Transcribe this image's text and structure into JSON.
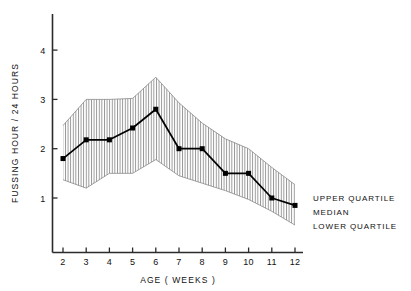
{
  "chart_data": {
    "type": "line",
    "title": "",
    "subtitle": "",
    "xlabel": "AGE  ( WEEKS )",
    "ylabel": "FUSSING HOUR / 24 HOURS",
    "x": [
      2,
      3,
      4,
      5,
      6,
      7,
      8,
      9,
      10,
      11,
      12
    ],
    "xtick_labels": [
      "2",
      "3",
      "4",
      "5",
      "6",
      "7",
      "8",
      "9",
      "10",
      "11",
      "12"
    ],
    "ytick_labels": [
      "1",
      "2",
      "3",
      "4"
    ],
    "yticks": [
      1,
      2,
      3,
      4
    ],
    "xlim": [
      1.55,
      12.6
    ],
    "ylim": [
      0.15,
      4.75
    ],
    "grid": false,
    "legend_position": "right",
    "series": [
      {
        "name": "UPPER QUARTILE",
        "values": [
          2.47,
          3.0,
          3.0,
          3.02,
          3.45,
          2.93,
          2.52,
          2.2,
          2.0,
          1.62,
          1.27
        ]
      },
      {
        "name": "MEDIAN",
        "values": [
          1.8,
          2.18,
          2.18,
          2.42,
          2.8,
          2.0,
          2.0,
          1.5,
          1.5,
          1.0,
          0.85
        ]
      },
      {
        "name": "LOWER QUARTILE",
        "values": [
          1.37,
          1.2,
          1.5,
          1.5,
          1.78,
          1.45,
          1.3,
          1.15,
          0.97,
          0.73,
          0.45
        ]
      }
    ],
    "band_fill": "hatch-vertical",
    "marker": "filled-square",
    "line_color": "#000000",
    "band_line_color": "#555555"
  },
  "legend": {
    "items": [
      {
        "label": "UPPER QUARTILE"
      },
      {
        "label": "MEDIAN"
      },
      {
        "label": "LOWER QUARTILE"
      }
    ]
  },
  "axes": {
    "y_title": "FUSSING HOUR / 24 HOURS",
    "x_title": "AGE  ( WEEKS )"
  },
  "colors": {
    "axis": "#2b2b2b",
    "line": "#000000",
    "hatch": "#6b6b6b",
    "background": "#ffffff",
    "text": "#111111"
  }
}
